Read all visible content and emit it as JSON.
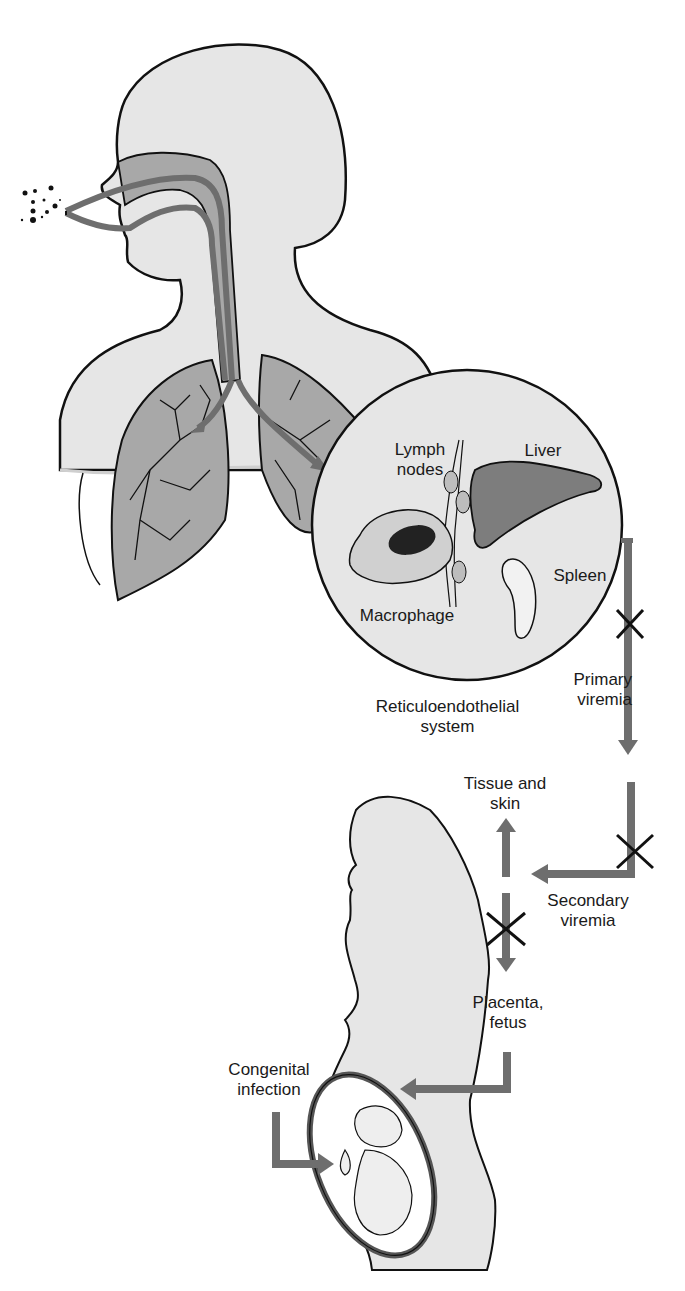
{
  "diagram": {
    "labels": {
      "lymph_nodes": "Lymph\nnodes",
      "liver": "Liver",
      "spleen": "Spleen",
      "macrophage": "Macrophage",
      "reticuloendothelial_system": "Reticuloendothelial\nsystem",
      "primary_viremia": "Primary\nviremia",
      "tissue_and_skin": "Tissue and\nskin",
      "secondary_viremia": "Secondary\nviremia",
      "placenta_fetus": "Placenta,\nfetus",
      "congenital_infection": "Congenital\ninfection"
    },
    "colors": {
      "body_fill": "#e6e6e6",
      "organ_fill": "#a8a8a8",
      "arrow_fill": "#6e6e6e",
      "outline": "#111111",
      "background": "#ffffff"
    }
  }
}
